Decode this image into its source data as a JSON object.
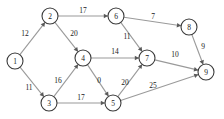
{
  "figure": {
    "background_color": "#ffffff",
    "node_stroke_color": "#3a3a3a",
    "node_fill_color": "#ffffff",
    "edge_color": "#9a9a9a",
    "arrow_color": "#5a5a5a",
    "text_color": "#1a1a1a"
  },
  "chart_data": {
    "type": "diagram",
    "title": "",
    "xlabel": "",
    "ylabel": "",
    "grid": false,
    "legend": null,
    "directed": true,
    "weighted": true,
    "nodes": [
      {
        "id": "1",
        "label": "1",
        "x": 15,
        "y": 61
      },
      {
        "id": "2",
        "label": "2",
        "x": 50,
        "y": 16
      },
      {
        "id": "3",
        "label": "3",
        "x": 49,
        "y": 103
      },
      {
        "id": "4",
        "label": "4",
        "x": 83,
        "y": 58
      },
      {
        "id": "5",
        "label": "5",
        "x": 113,
        "y": 103
      },
      {
        "id": "6",
        "label": "6",
        "x": 116,
        "y": 16
      },
      {
        "id": "7",
        "label": "7",
        "x": 147,
        "y": 58
      },
      {
        "id": "8",
        "label": "8",
        "x": 189,
        "y": 27
      },
      {
        "id": "9",
        "label": "9",
        "x": 206,
        "y": 72
      }
    ],
    "node_radius": 8,
    "edges": [
      {
        "from": "1",
        "to": "2",
        "weight": "12",
        "lx": 25,
        "ly": 33
      },
      {
        "from": "1",
        "to": "3",
        "weight": "11",
        "lx": 29,
        "ly": 87
      },
      {
        "from": "2",
        "to": "6",
        "weight": "17",
        "lx": 83,
        "ly": 10
      },
      {
        "from": "2",
        "to": "4",
        "weight": "20",
        "lx": 74,
        "ly": 33
      },
      {
        "from": "3",
        "to": "4",
        "weight": "16",
        "lx": 58,
        "ly": 80
      },
      {
        "from": "3",
        "to": "5",
        "weight": "17",
        "lx": 81,
        "ly": 97
      },
      {
        "from": "4",
        "to": "7",
        "weight": "14",
        "lx": 115,
        "ly": 51
      },
      {
        "from": "4",
        "to": "5",
        "weight": "0",
        "lx": 99,
        "ly": 80
      },
      {
        "from": "5",
        "to": "7",
        "weight": "20",
        "lx": 125,
        "ly": 82
      },
      {
        "from": "5",
        "to": "9",
        "weight": "25",
        "lx": 153,
        "ly": 85
      },
      {
        "from": "6",
        "to": "8",
        "weight": "7",
        "lx": 153,
        "ly": 16
      },
      {
        "from": "6",
        "to": "7",
        "weight": "11",
        "lx": 127,
        "ly": 36
      },
      {
        "from": "7",
        "to": "9",
        "weight": "10",
        "lx": 175,
        "ly": 54
      },
      {
        "from": "8",
        "to": "9",
        "weight": "9",
        "lx": 203,
        "ly": 46
      }
    ]
  }
}
